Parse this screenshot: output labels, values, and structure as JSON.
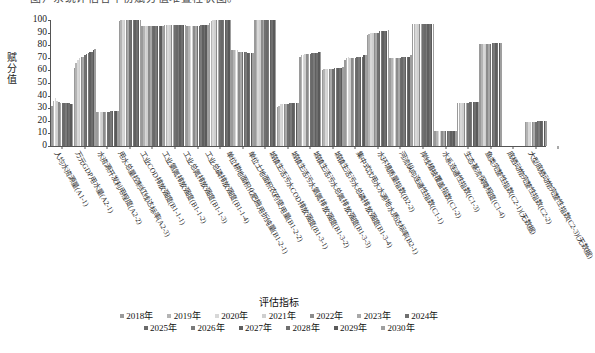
{
  "caption": {
    "cut_off_line": "图）系统评估各年份赋分值堆叠柱状图。"
  },
  "chart_data": {
    "type": "bar",
    "title": "",
    "xlabel": "评估指标",
    "ylabel": "赋分值",
    "ylim": [
      0,
      100
    ],
    "yticks": [
      0,
      10,
      20,
      30,
      40,
      50,
      60,
      70,
      80,
      90,
      100
    ],
    "grid": false,
    "legend_position": "bottom",
    "legend_title": "",
    "categories": [
      "人均水资源量(A1-1)",
      "万元GDP用水量(A2-1)",
      "水资源开发利用程度(A2-2)",
      "用水总量控制红线达标率(A2-3)",
      "工业COD排放强度(B1-1-1)",
      "工业氨氮排放强度(B1-1-2)",
      "工业总氮排放强度(B1-1-3)",
      "工业总磷排放强度(B1-1-4)",
      "单位耕地面积化肥施用折纯量(B1-2-1)",
      "单位土地面积农药使用量(B1-2-2)",
      "城镇生活污水COD排放强度(B1-3-1)",
      "城镇生活污水氨氮排放强度(B1-3-2)",
      "城镇生活污水总氮排放强度(B1-3-3)",
      "城镇生活污水总磷排放强度(B1-3-4)",
      "集中式饮用水水源地水质达标率(B2-1)",
      "水环境质量指数(B2-2)",
      "河流纵向连通性指数(C1-1)",
      "岸线植被覆盖指数(C1-2)",
      "水系连通性指数(C1-3)",
      "生态基流保障程度(C1-4)",
      "鱼类完整性指数(C2-1)(无数据)",
      "底栖动物完整性指数(C2-2)",
      "大型底栖动物完整性指数(C2-3)(无数据)"
    ],
    "series": [
      {
        "name": "2018年",
        "color": "#9a9a9a",
        "values": [
          32,
          62,
          27,
          99,
          95,
          96,
          95,
          98,
          76,
          100,
          31,
          71,
          60,
          68,
          88,
          70,
          97,
          12,
          34,
          81,
          0,
          19,
          0
        ]
      },
      {
        "name": "2019年",
        "color": "#b4b4b4",
        "values": [
          36,
          66,
          27,
          100,
          95,
          96,
          95,
          99,
          76,
          100,
          32,
          72,
          61,
          70,
          89,
          70,
          97,
          12,
          34,
          81,
          0,
          19,
          0
        ]
      },
      {
        "name": "2020年",
        "color": "#d8d8d8",
        "values": [
          38,
          68,
          27,
          100,
          95,
          96,
          95,
          100,
          76,
          100,
          33,
          72,
          61,
          71,
          90,
          70,
          97,
          12,
          34,
          81,
          0,
          19,
          0
        ]
      },
      {
        "name": "2021年",
        "color": "#cfcfcf",
        "values": [
          36,
          70,
          27,
          100,
          95,
          96,
          95,
          100,
          76,
          100,
          33,
          73,
          61,
          70,
          90,
          70,
          97,
          12,
          34,
          81,
          0,
          19,
          0
        ]
      },
      {
        "name": "2022年",
        "color": "#8c8c8c",
        "values": [
          35,
          71,
          27,
          100,
          95,
          96,
          95,
          100,
          75,
          100,
          33,
          73,
          61,
          70,
          90,
          70,
          97,
          12,
          34,
          81,
          0,
          19,
          0
        ]
      },
      {
        "name": "2023年",
        "color": "#a8a8a8",
        "values": [
          34,
          71,
          27,
          100,
          95,
          96,
          95,
          100,
          75,
          100,
          33,
          73,
          61,
          70,
          90,
          70,
          97,
          12,
          34,
          81,
          0,
          19,
          0
        ]
      },
      {
        "name": "2024年",
        "color": "#707070",
        "values": [
          34,
          72,
          27,
          100,
          95,
          96,
          95,
          100,
          75,
          100,
          33,
          73,
          61,
          70,
          90,
          70,
          97,
          12,
          34,
          81,
          0,
          19,
          0
        ]
      },
      {
        "name": "2025年",
        "color": "#6a6a6a",
        "values": [
          34,
          73,
          27,
          100,
          95,
          96,
          95,
          100,
          75,
          100,
          34,
          74,
          62,
          71,
          91,
          71,
          97,
          12,
          35,
          82,
          0,
          20,
          0
        ]
      },
      {
        "name": "2026年",
        "color": "#7a7a7a",
        "values": [
          34,
          74,
          28,
          100,
          95,
          96,
          96,
          100,
          75,
          100,
          34,
          74,
          62,
          71,
          91,
          71,
          97,
          12,
          35,
          82,
          0,
          20,
          0
        ]
      },
      {
        "name": "2027年",
        "color": "#5f5f5f",
        "values": [
          34,
          75,
          28,
          100,
          95,
          96,
          96,
          100,
          74,
          100,
          34,
          74,
          62,
          71,
          91,
          71,
          97,
          12,
          35,
          82,
          0,
          20,
          0
        ]
      },
      {
        "name": "2028年",
        "color": "#6f6f6f",
        "values": [
          34,
          75,
          28,
          100,
          95,
          96,
          96,
          100,
          74,
          100,
          34,
          74,
          62,
          71,
          91,
          71,
          97,
          12,
          35,
          82,
          0,
          20,
          0
        ]
      },
      {
        "name": "2029年",
        "color": "#5a5a5a",
        "values": [
          33,
          76,
          28,
          100,
          95,
          96,
          96,
          100,
          74,
          100,
          34,
          75,
          62,
          72,
          91,
          71,
          97,
          12,
          35,
          82,
          0,
          20,
          0
        ]
      },
      {
        "name": "2030年",
        "color": "#9f9f9f",
        "values": [
          33,
          77,
          28,
          100,
          95,
          96,
          96,
          100,
          74,
          100,
          34,
          75,
          63,
          72,
          92,
          72,
          97,
          12,
          35,
          82,
          0,
          20,
          0
        ]
      }
    ]
  }
}
